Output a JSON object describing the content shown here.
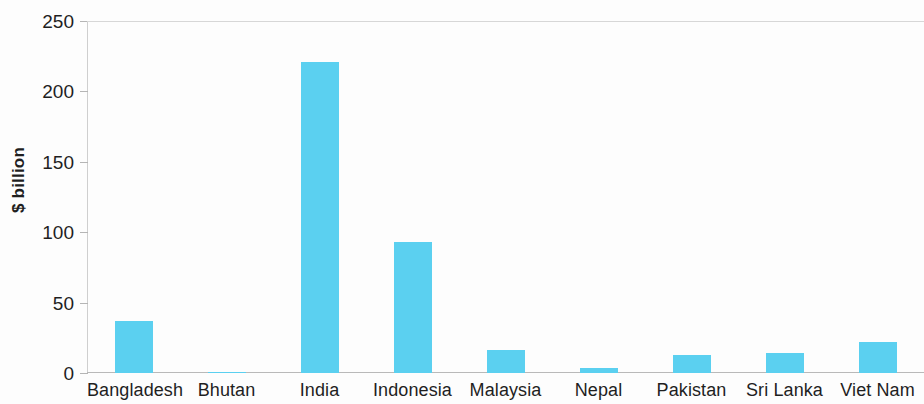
{
  "chart_data": {
    "type": "bar",
    "title": "",
    "subtitle": "",
    "xlabel": "",
    "ylabel": "$ billion",
    "ylim": [
      0,
      250
    ],
    "yticks": [
      0,
      50,
      100,
      150,
      200,
      250
    ],
    "ytick_labels": [
      "0",
      "50",
      "100",
      "150",
      "200",
      "250"
    ],
    "grid": false,
    "legend": null,
    "bar_color": "#5bd0f0",
    "categories": [
      "Bangladesh",
      "Bhutan",
      "India",
      "Indonesia",
      "Malaysia",
      "Nepal",
      "Pakistan",
      "Sri Lanka",
      "Viet Nam"
    ],
    "values": [
      37,
      0.3,
      221,
      93,
      16,
      3.5,
      13,
      14,
      22
    ],
    "series": [
      {
        "name": "$ billion",
        "values": [
          37,
          0.3,
          221,
          93,
          16,
          3.5,
          13,
          14,
          22
        ]
      }
    ]
  },
  "axes": {
    "y_title": "$ billion"
  }
}
